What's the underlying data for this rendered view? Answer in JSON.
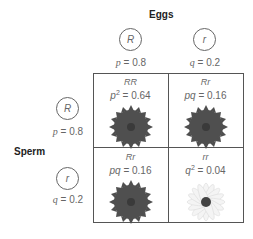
{
  "labels": {
    "eggs": "Eggs",
    "sperm": "Sperm"
  },
  "eggs": [
    {
      "allele": "R",
      "freq_var": "p",
      "freq_text": " = 0.8"
    },
    {
      "allele": "r",
      "freq_var": "q",
      "freq_text": " = 0.2"
    }
  ],
  "sperm": [
    {
      "allele": "R",
      "freq_var": "p",
      "freq_text": " = 0.8"
    },
    {
      "allele": "r",
      "freq_var": "q",
      "freq_text": " = 0.2"
    }
  ],
  "cells": [
    {
      "genotype": "RR",
      "expr": "p",
      "exp": "2",
      "value": " = 0.64",
      "flower": "red",
      "flower_color": "#4a4a4a"
    },
    {
      "genotype": "Rr",
      "expr": "pq",
      "exp": "",
      "value": " = 0.16",
      "flower": "red",
      "flower_color": "#4a4a4a"
    },
    {
      "genotype": "Rr",
      "expr": "pq",
      "exp": "",
      "value": " = 0.16",
      "flower": "red",
      "flower_color": "#4a4a4a"
    },
    {
      "genotype": "rr",
      "expr": "q",
      "exp": "2",
      "value": " = 0.04",
      "flower": "white",
      "flower_color": "#f2f2f2"
    }
  ]
}
